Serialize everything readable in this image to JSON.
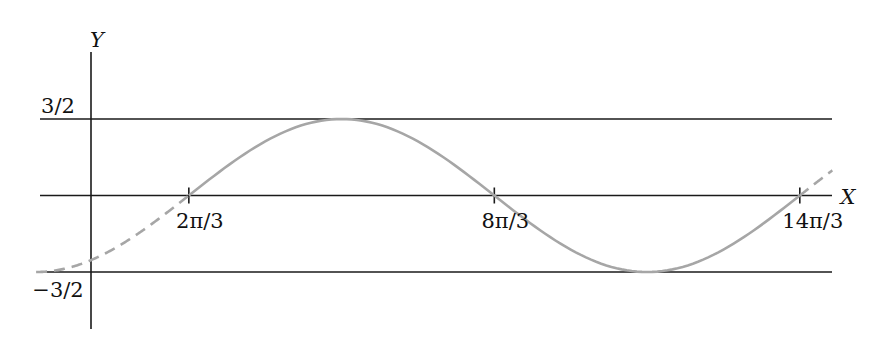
{
  "chart_data": {
    "type": "line",
    "title": "",
    "xlabel": "X",
    "ylabel": "Y",
    "function": "y = (3/2) sin((x - 2π/3)/2)",
    "amplitude": 1.5,
    "xlim": [
      -1.047,
      15.33
    ],
    "ylim": [
      -2.1,
      2.8
    ],
    "grid": false,
    "legend": "none",
    "x_ticks": [
      {
        "value": 2.0944,
        "label": "2π/3"
      },
      {
        "value": 8.3776,
        "label": "8π/3"
      },
      {
        "value": 14.6608,
        "label": "14π/3"
      }
    ],
    "y_ticks": [
      {
        "value": 1.5,
        "label": "3/2"
      },
      {
        "value": -1.5,
        "label": "−3/2"
      }
    ],
    "reference_lines": [
      {
        "y": 1.5,
        "label": "3/2"
      },
      {
        "y": 0,
        "label": "X axis"
      },
      {
        "y": -1.5,
        "label": "−3/2"
      }
    ],
    "series": [
      {
        "name": "dashed-left",
        "style": "dashed",
        "x_range": [
          -1.0472,
          2.0944
        ]
      },
      {
        "name": "solid",
        "style": "solid",
        "x_range": [
          2.0944,
          14.6608
        ]
      },
      {
        "name": "dashed-right",
        "style": "dashed",
        "x_range": [
          14.6608,
          15.33
        ]
      }
    ],
    "key_points": [
      {
        "x": -1.0472,
        "y": -1.5
      },
      {
        "x": 2.0944,
        "y": 0
      },
      {
        "x": 5.236,
        "y": 1.5
      },
      {
        "x": 8.3776,
        "y": 0
      },
      {
        "x": 11.5192,
        "y": -1.5
      },
      {
        "x": 14.6608,
        "y": 0
      }
    ],
    "colors": {
      "curve": "#a6a6a6",
      "axes": "#1a1a1a"
    }
  }
}
